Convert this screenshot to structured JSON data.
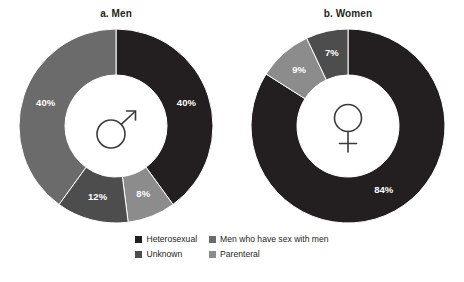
{
  "figure": {
    "background": "#ffffff"
  },
  "chart_data": [
    {
      "type": "pie",
      "title": "a. Men",
      "subtitle": "",
      "variant": "donut",
      "center_icon": "male-symbol-icon",
      "xlabel": "",
      "ylabel": "",
      "legend_position": "bottom",
      "grid": false,
      "start_angle_deg": 0,
      "direction": "clockwise",
      "categories": [
        "Heterosexual",
        "Parenteral",
        "Unknown",
        "Men who have sex with men"
      ],
      "values": [
        40,
        8,
        12,
        40
      ],
      "labels": [
        "40%",
        "8%",
        "12%",
        "40%"
      ],
      "colors": [
        "#231f20",
        "#8c8c8c",
        "#4d4d4d",
        "#6b6b6b"
      ]
    },
    {
      "type": "pie",
      "title": "b. Women",
      "subtitle": "",
      "variant": "donut",
      "center_icon": "female-symbol-icon",
      "xlabel": "",
      "ylabel": "",
      "legend_position": "bottom",
      "grid": false,
      "start_angle_deg": 0,
      "direction": "clockwise",
      "categories": [
        "Heterosexual",
        "Parenteral",
        "Unknown"
      ],
      "values": [
        84,
        9,
        7
      ],
      "labels": [
        "84%",
        "9%",
        "7%"
      ],
      "colors": [
        "#231f20",
        "#8c8c8c",
        "#4d4d4d"
      ]
    }
  ],
  "legend": {
    "items": [
      {
        "label": "Heterosexual",
        "color": "#231f20"
      },
      {
        "label": "Men who have sex with men",
        "color": "#6b6b6b"
      },
      {
        "label": "Unknown",
        "color": "#4d4d4d"
      },
      {
        "label": "Parenteral",
        "color": "#8c8c8c"
      }
    ]
  }
}
